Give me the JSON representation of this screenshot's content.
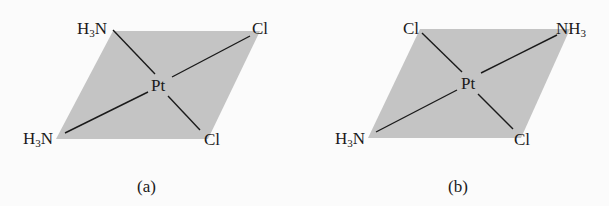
{
  "colors": {
    "background": "#fbfbfb",
    "plane_fill": "#c4c4c4",
    "bond_line": "#1a1a1a",
    "text": "#1a1a1a"
  },
  "figures": [
    {
      "caption": "(a)",
      "isomer": "cis",
      "center": "Pt",
      "plane_corners": [
        [
          113,
          31
        ],
        [
          260,
          31
        ],
        [
          208,
          139
        ],
        [
          56,
          139
        ]
      ],
      "center_pos": [
        161,
        83
      ],
      "ligands": {
        "top_left": {
          "base": "H",
          "sub": "3",
          "tail": "N"
        },
        "top_right": {
          "base": "Cl"
        },
        "bottom_left": {
          "base": "H",
          "sub": "3",
          "tail": "N"
        },
        "bottom_right": {
          "base": "Cl"
        }
      }
    },
    {
      "caption": "(b)",
      "isomer": "trans",
      "center": "Pt",
      "plane_corners": [
        [
          420,
          29
        ],
        [
          570,
          29
        ],
        [
          521,
          138
        ],
        [
          368,
          138
        ]
      ],
      "center_pos": [
        470,
        81
      ],
      "ligands": {
        "top_left": {
          "base": "Cl"
        },
        "top_right": {
          "base": "NH",
          "sub": "3"
        },
        "bottom_left": {
          "base": "H",
          "sub": "3",
          "tail": "N"
        },
        "bottom_right": {
          "base": "Cl"
        }
      }
    }
  ]
}
